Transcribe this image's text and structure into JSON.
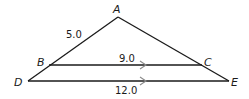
{
  "diagram": {
    "type": "similar-triangles",
    "points": {
      "A": {
        "label": "A",
        "x": 118,
        "y": 17
      },
      "B": {
        "label": "B",
        "x": 49,
        "y": 65
      },
      "C": {
        "label": "C",
        "x": 202,
        "y": 65
      },
      "D": {
        "label": "D",
        "x": 28,
        "y": 81
      },
      "E": {
        "label": "E",
        "x": 229,
        "y": 81
      }
    },
    "segments": [
      {
        "from": "A",
        "to": "D"
      },
      {
        "from": "A",
        "to": "E"
      },
      {
        "from": "B",
        "to": "C",
        "parallel_mark": true
      },
      {
        "from": "D",
        "to": "E",
        "parallel_mark": true
      }
    ],
    "measurements": {
      "AB": "5.0",
      "BC": "9.0",
      "DE": "12.0"
    },
    "colors": {
      "line": "#1a1a1a",
      "parallel_marker": "#8a8a8a"
    }
  }
}
